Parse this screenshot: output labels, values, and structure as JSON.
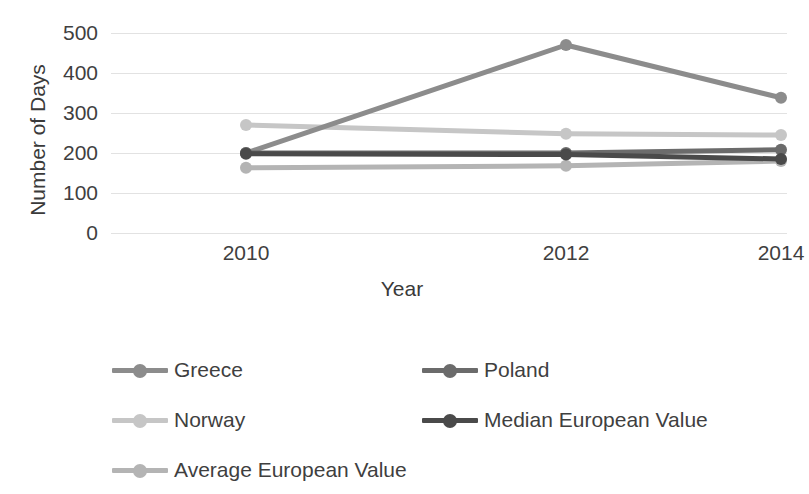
{
  "chart_data": {
    "type": "line",
    "title": "",
    "xlabel": "Year",
    "ylabel": "Number of Days",
    "categories": [
      "2010",
      "2012",
      "2014"
    ],
    "x": [
      2010,
      2012,
      2014
    ],
    "ylim": [
      0,
      500
    ],
    "yticks": [
      "0",
      "100",
      "200",
      "300",
      "400",
      "500"
    ],
    "ytick_values": [
      0,
      100,
      200,
      300,
      400,
      500
    ],
    "grid": true,
    "legend_position": "bottom",
    "series": [
      {
        "name": "Greece",
        "values": [
          200,
          470,
          338
        ],
        "color": "#8c8c8c"
      },
      {
        "name": "Poland",
        "values": [
          200,
          200,
          208
        ],
        "color": "#6b6b6b"
      },
      {
        "name": "Norway",
        "values": [
          270,
          248,
          245
        ],
        "color": "#c6c6c6"
      },
      {
        "name": "Median European Value",
        "values": [
          198,
          196,
          185
        ],
        "color": "#4a4a4a"
      },
      {
        "name": "Average European Value",
        "values": [
          163,
          168,
          180
        ],
        "color": "#b4b4b4"
      }
    ]
  },
  "legend": {
    "items": [
      {
        "label": "Greece",
        "color": "#8c8c8c"
      },
      {
        "label": "Poland",
        "color": "#6b6b6b"
      },
      {
        "label": "Norway",
        "color": "#c6c6c6"
      },
      {
        "label": "Median European Value",
        "color": "#4a4a4a"
      },
      {
        "label": "Average European Value",
        "color": "#b4b4b4"
      }
    ]
  },
  "axes": {
    "y_title": "Number of Days",
    "x_title": "Year"
  }
}
